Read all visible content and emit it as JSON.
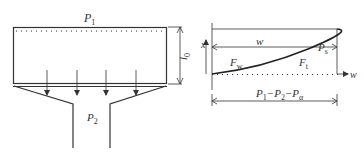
{
  "left_diagram": {
    "top_pressure_label": "P",
    "top_pressure_sub": "1",
    "height_label": "l",
    "height_sub": "0",
    "bottom_pressure_label": "P",
    "bottom_pressure_sub": "2",
    "flow_arrow_count": 4
  },
  "right_diagram": {
    "x_axis_label": "x",
    "w_axis_label": "w",
    "width_label": "w",
    "ps_label": "P",
    "ps_sub": "s",
    "fw_label": "F",
    "fw_sub": "w",
    "ft_label": "F",
    "ft_sub": "t",
    "bottom_label": "P",
    "bottom_label_parts": [
      "P",
      "1",
      "−P",
      "2",
      "−P",
      "α"
    ]
  },
  "colors": {
    "line": "#333333",
    "background": "#ffffff"
  }
}
